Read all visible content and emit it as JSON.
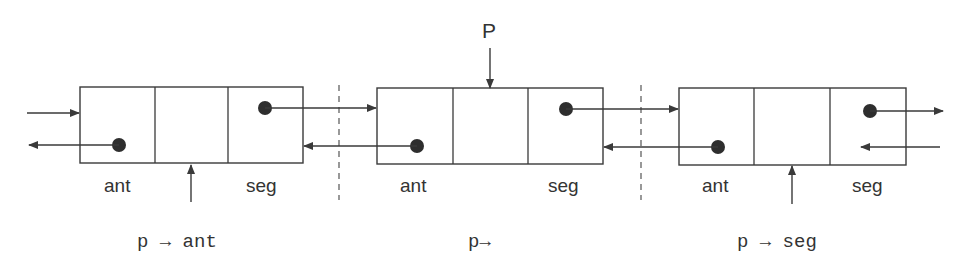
{
  "diagram": {
    "type": "doubly-linked-list",
    "pointer_label": "P",
    "nodes": [
      {
        "id": "prev",
        "fields": [
          "ant",
          "",
          "seg"
        ],
        "left_label": "ant",
        "right_label": "seg",
        "caption": "p → ant"
      },
      {
        "id": "current",
        "fields": [
          "ant",
          "",
          "seg"
        ],
        "left_label": "ant",
        "right_label": "seg",
        "caption": "p→"
      },
      {
        "id": "next",
        "fields": [
          "ant",
          "",
          "seg"
        ],
        "left_label": "ant",
        "right_label": "seg",
        "caption": "p → seg"
      }
    ],
    "colors": {
      "stroke": "#3a3a3a",
      "dot": "#2e2e2e",
      "text": "#333333",
      "background": "#ffffff"
    }
  }
}
